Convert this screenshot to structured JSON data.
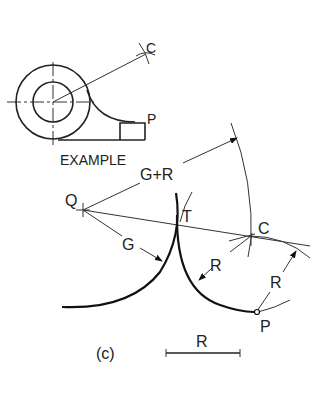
{
  "figure": {
    "caption": "(c)",
    "example": {
      "title": "EXAMPLE",
      "labels": {
        "center_point": "C",
        "point": "P"
      }
    },
    "construction": {
      "labels": {
        "q": "Q",
        "t": "T",
        "c": "C",
        "p": "P",
        "g_plus_r": "G+R",
        "g": "G",
        "r_arrow_1": "R",
        "r_arrow_2": "R"
      },
      "scale_bar_label": "R"
    }
  }
}
